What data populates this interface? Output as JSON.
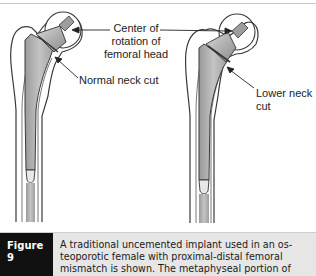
{
  "figure": {
    "labels": {
      "center_of_rotation": "Center of\nrotation of\nfemoral head",
      "normal_neck_cut": "Normal neck cut",
      "lower_neck_cut": "Lower neck\ncut"
    },
    "panels": [
      {
        "name": "left-femur",
        "description": "Implant with normal neck cut"
      },
      {
        "name": "right-femur",
        "description": "Implant with lower neck cut"
      }
    ],
    "colors": {
      "bone_outline": "#3a3a3a",
      "implant_fill": "#b5b5b5",
      "bone_fill": "#ffffff",
      "caption_tag_bg": "#111111",
      "caption_bg": "#e6e6e6"
    }
  },
  "caption": {
    "tag": "Figure 9",
    "text": "A traditional uncemented implant used in an os-\nteoporotic female with proximal-distal femoral\nmismatch is shown. The metaphyseal portion of"
  }
}
